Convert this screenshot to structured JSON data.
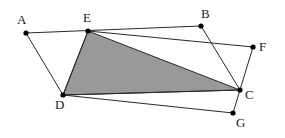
{
  "diagram": {
    "type": "geometry",
    "colors": {
      "background": "#ffffff",
      "stroke": "#2a2a2a",
      "shade": "#999999",
      "point": "#000000",
      "label": "#222222"
    },
    "points": {
      "A": {
        "label": "A",
        "x": 26,
        "y": 33
      },
      "E": {
        "label": "E",
        "x": 88,
        "y": 31
      },
      "B": {
        "label": "B",
        "x": 201,
        "y": 26
      },
      "F": {
        "label": "F",
        "x": 253,
        "y": 47
      },
      "C": {
        "label": "C",
        "x": 240,
        "y": 90
      },
      "G": {
        "label": "G",
        "x": 233,
        "y": 113
      },
      "D": {
        "label": "D",
        "x": 63,
        "y": 95
      }
    },
    "polygons": [
      {
        "name": "parallelogram-ABCD",
        "vertices": [
          "A",
          "B",
          "C",
          "D"
        ]
      },
      {
        "name": "quadrilateral-EFGD",
        "vertices": [
          "E",
          "F",
          "G",
          "D"
        ]
      }
    ],
    "shaded_triangle": {
      "name": "triangle-DEC",
      "vertices": [
        "D",
        "E",
        "C"
      ]
    }
  }
}
